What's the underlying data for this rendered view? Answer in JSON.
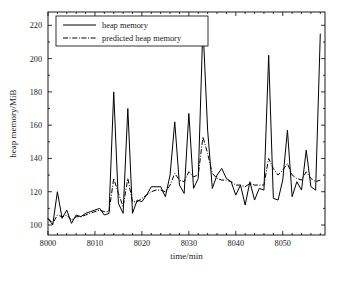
{
  "chart_data": {
    "type": "line",
    "title": "",
    "xlabel": "time/min",
    "ylabel": "heap memory/MiB",
    "xlim": [
      8000,
      8059
    ],
    "ylim": [
      94,
      228
    ],
    "xticks": [
      8000,
      8010,
      8020,
      8030,
      8040,
      8050
    ],
    "yticks": [
      100,
      120,
      140,
      160,
      180,
      200,
      220
    ],
    "grid": false,
    "legend_position": "upper-left",
    "legend": [
      "heap memory",
      "predicted heap memory"
    ],
    "x": [
      8000,
      8001,
      8002,
      8003,
      8004,
      8005,
      8006,
      8007,
      8008,
      8009,
      8010,
      8011,
      8012,
      8013,
      8014,
      8015,
      8016,
      8017,
      8018,
      8019,
      8020,
      8021,
      8022,
      8023,
      8024,
      8025,
      8026,
      8027,
      8028,
      8029,
      8030,
      8031,
      8032,
      8033,
      8034,
      8035,
      8036,
      8037,
      8038,
      8039,
      8040,
      8041,
      8042,
      8043,
      8044,
      8045,
      8046,
      8047,
      8048,
      8049,
      8050,
      8051,
      8052,
      8053,
      8054,
      8055,
      8056,
      8057,
      8058
    ],
    "series": [
      {
        "name": "heap memory",
        "style": "solid",
        "color": "#000000",
        "values": [
          104,
          100,
          120,
          104,
          109,
          101,
          106,
          105,
          107,
          108,
          109,
          110,
          106,
          107,
          180,
          113,
          107,
          170,
          107,
          115,
          114,
          118,
          123,
          123,
          123,
          117,
          130,
          162,
          124,
          119,
          167,
          122,
          128,
          220,
          157,
          122,
          130,
          134,
          128,
          126,
          118,
          124,
          112,
          126,
          115,
          122,
          121,
          202,
          116,
          115,
          127,
          157,
          117,
          126,
          121,
          145,
          123,
          121,
          215
        ]
      },
      {
        "name": "predicted heap memory",
        "style": "dashdot",
        "color": "#000000",
        "values": [
          104,
          101,
          106,
          105,
          106,
          103,
          105,
          105,
          106,
          107,
          108,
          109,
          108,
          108,
          128,
          119,
          111,
          128,
          114,
          114,
          116,
          118,
          120,
          121,
          121,
          120,
          124,
          131,
          127,
          126,
          132,
          129,
          130,
          153,
          143,
          131,
          128,
          127,
          127,
          126,
          124,
          124,
          123,
          125,
          124,
          124,
          124,
          140,
          134,
          130,
          133,
          137,
          130,
          128,
          127,
          132,
          128,
          126,
          127
        ]
      }
    ]
  }
}
